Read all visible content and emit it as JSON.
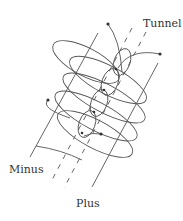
{
  "figure": {
    "labels": {
      "tunnel": "Tunnel",
      "minus": "Minus",
      "plus": "Plus"
    },
    "colors": {
      "stroke": "#555555",
      "text": "#333333",
      "background": "#ffffff"
    },
    "elements": {
      "loops": 5,
      "rails": [
        "minus",
        "plus"
      ],
      "tunnel_dashes": 2
    }
  }
}
